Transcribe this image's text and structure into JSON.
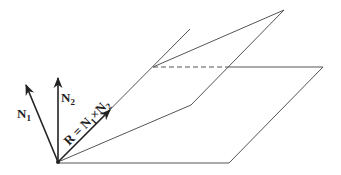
{
  "diagram": {
    "colors": {
      "line": "#555555",
      "vector": "#222222",
      "background": "#ffffff"
    },
    "vectors": [
      {
        "id": "N1",
        "label": "N",
        "subscript": "1"
      },
      {
        "id": "N2",
        "label": "N",
        "subscript": "2"
      },
      {
        "id": "R",
        "label_prefix": "R = N",
        "sub1": "1",
        "cross": "×N",
        "sub2": "2"
      }
    ],
    "planes": [
      {
        "id": "upper-plane",
        "style": "solid"
      },
      {
        "id": "lower-plane",
        "style": "solid",
        "hidden_edge": "dashed"
      }
    ]
  }
}
